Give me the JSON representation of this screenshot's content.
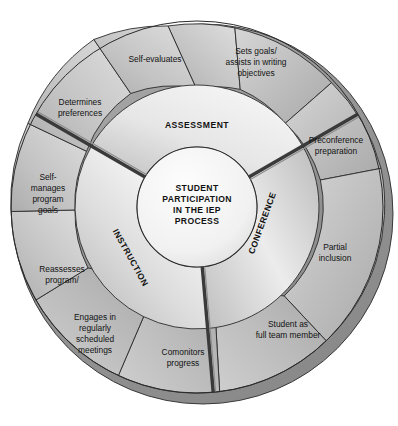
{
  "figure": {
    "title": "Student Participation in the IEP Process",
    "type": "concentric-wheel-diagram",
    "hub": {
      "lines": [
        "STUDENT",
        "PARTICIPATION",
        "IN THE IEP",
        "PROCESS"
      ]
    },
    "colors": {
      "page_background": "#ffffff",
      "outline": "#2b2b2b",
      "hub_fill": "#f2f2f2",
      "inner_ring_light": "#efefef",
      "inner_ring_mid": "#c9c9c9",
      "outer_ring_light": "#dadada",
      "outer_ring_mid": "#b3b3b3",
      "outer_ring_dark": "#9a9a9a",
      "rim_shadow": "#8f8f8f",
      "divider_dark": "#3a3a3a",
      "text": "#121212"
    },
    "bands": [
      {
        "id": "assessment",
        "label": "ASSESSMENT",
        "orientation": "horizontal"
      },
      {
        "id": "conference",
        "label": "CONFERENCE",
        "orientation": "rotated-bottom-to-top"
      },
      {
        "id": "instruction",
        "label": "INSTRUCTION",
        "orientation": "rotated-top-to-bottom"
      }
    ],
    "outer_segments": [
      {
        "id": "self-evaluates",
        "band": "assessment",
        "lines": [
          "Self-evaluates"
        ]
      },
      {
        "id": "sets-goals",
        "band": "assessment",
        "lines": [
          "Sets goals/",
          "assists in writing",
          "objectives"
        ]
      },
      {
        "id": "preconference-preparation",
        "band": "conference",
        "lines": [
          "Preconference",
          "preparation"
        ]
      },
      {
        "id": "partial-inclusion",
        "band": "conference",
        "lines": [
          "Partial",
          "inclusion"
        ]
      },
      {
        "id": "student-as-full-team-member",
        "band": "conference",
        "lines": [
          "Student as",
          "full team member"
        ]
      },
      {
        "id": "comonitors-progress",
        "band": "instruction",
        "lines": [
          "Comonitors",
          "progress"
        ]
      },
      {
        "id": "engages-in-meetings",
        "band": "instruction",
        "lines": [
          "Engages in",
          "regularly",
          "scheduled",
          "meetings"
        ]
      },
      {
        "id": "reassesses-program",
        "band": "instruction",
        "lines": [
          "Reassesses",
          "program/"
        ]
      },
      {
        "id": "self-manages-program-goals",
        "band": "instruction",
        "lines": [
          "Self-",
          "manages",
          "program",
          "goals"
        ]
      },
      {
        "id": "determines-preferences",
        "band": "assessment",
        "lines": [
          "Determines",
          "preferences"
        ]
      }
    ]
  }
}
